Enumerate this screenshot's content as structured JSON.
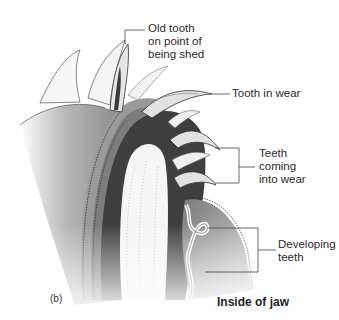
{
  "diagram": {
    "panel_label": "(b)",
    "caption": "Inside of jaw",
    "labels": [
      {
        "id": "old-tooth",
        "text": "Old tooth\non point of\nbeing shed"
      },
      {
        "id": "tooth-in-wear",
        "text": "Tooth in wear"
      },
      {
        "id": "teeth-coming",
        "text": "Teeth\ncoming\ninto wear"
      },
      {
        "id": "developing-teeth",
        "text": "Developing\nteeth"
      }
    ],
    "colors": {
      "background": "#ffffff",
      "jaw_dark": "#3a3a3a",
      "jaw_mid": "#8a8a8a",
      "jaw_light": "#bdbdbd",
      "tooth_fill": "#e4e4e4",
      "outline": "#333333",
      "leader_line": "#444444"
    }
  }
}
